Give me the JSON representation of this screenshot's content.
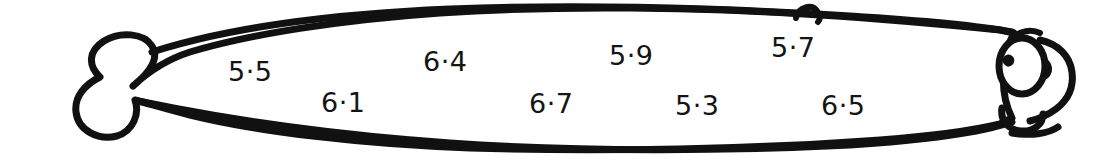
{
  "figure": {
    "kind": "hand-drawn-fish-outline",
    "ink_color": "#111111",
    "background_color": "#ffffff",
    "fill_color": "#ffffff",
    "parts": [
      "tail-fin",
      "body-outline",
      "dorsal-bump",
      "eye",
      "pupil",
      "eyebrow",
      "cheek",
      "mouth",
      "lower-lip"
    ]
  },
  "labels": [
    {
      "text": "5·5",
      "x": 228,
      "y": 58
    },
    {
      "text": "6·1",
      "x": 321,
      "y": 89
    },
    {
      "text": "6·4",
      "x": 423,
      "y": 48
    },
    {
      "text": "6·7",
      "x": 529,
      "y": 90
    },
    {
      "text": "5·9",
      "x": 609,
      "y": 42
    },
    {
      "text": "5·3",
      "x": 675,
      "y": 92
    },
    {
      "text": "5·7",
      "x": 771,
      "y": 34
    },
    {
      "text": "6·5",
      "x": 821,
      "y": 92
    }
  ],
  "label_values": [
    "5.5",
    "6.1",
    "6.4",
    "6.7",
    "5.9",
    "5.3",
    "5.7",
    "6.5"
  ]
}
